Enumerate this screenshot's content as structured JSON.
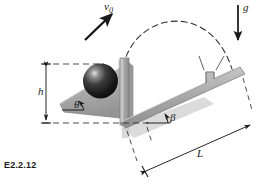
{
  "figure": {
    "caption": "E2.2.12",
    "labels": {
      "velocity": "v",
      "velocity_sub": "0",
      "gravity": "g",
      "height": "h",
      "theta": "θ",
      "beta": "β",
      "length": "L"
    },
    "colors": {
      "ink": "#1a1a1a",
      "ramp_fill": "#a8a8a8",
      "ramp_fill_light": "#c4c4c4",
      "ramp_fill_dark": "#8e8e8e",
      "ball_dark": "#141414",
      "ball_mid": "#3a3a3a",
      "ball_highlight": "#d9d9d9",
      "shadow": "#bdbdbd",
      "background": "#ffffff"
    },
    "elements": {
      "ball": "sphere resting on upper inclined ramp",
      "velocity_arrow": "solid arrow up-right from ball, launch velocity",
      "gravity_arrow": "solid arrow pointing down at right, gravity",
      "trajectory": "dashed parabolic arc from ball over to lower incline",
      "upper_ramp": "gray triangular wedge inclined at theta",
      "post": "vertical gray support post",
      "lower_incline": "gray inclined plane at angle beta with notch step at right",
      "height_dimension": "vertical double-arrow dimension h with dashed extension lines",
      "length_dimension": "inclined double-arrow dimension L with dashed extension lines",
      "baseline": "horizontal dashed reference line at base"
    }
  }
}
